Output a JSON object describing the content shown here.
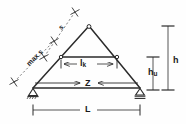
{
  "figure": {
    "type": "structural-truss-diagram",
    "stroke_color": "#2b2b2b",
    "label_color": "#1a1a1a",
    "background_color": "#fefefe",
    "width": 186,
    "height": 124
  },
  "labels": {
    "rafter_segment": "s",
    "rafter_max": "max s",
    "collar_tie": "l",
    "collar_tie_sub": "k",
    "tie_force": "Z",
    "span": "L",
    "total_height": "h",
    "lower_height": "h",
    "lower_height_sub": "u"
  },
  "geometry": {
    "apex": [
      89,
      26
    ],
    "left_support": [
      33,
      88
    ],
    "right_support": [
      140,
      88
    ],
    "collar_left": [
      61,
      57
    ],
    "collar_right": [
      117,
      57
    ],
    "span_dim_y": 110,
    "height_dim_x": 168,
    "lower_height_dim_x": 153,
    "collar_dim_y": 64,
    "tie_arrow_y": 83
  },
  "elements": {
    "left_support_name": "pinned-support",
    "right_support_name": "roller-support",
    "node_marker": "circle"
  }
}
